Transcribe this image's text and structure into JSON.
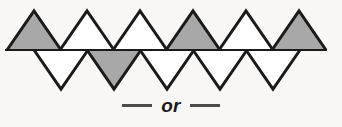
{
  "figure": {
    "name": "triangle-strip-tessellation",
    "background_color": "#f8f7f5",
    "stroke_color": "#1a1a1a",
    "shaded_fill": "#a8a8a8",
    "unshaded_fill": "#ffffff",
    "stroke_width": 3,
    "geometry": {
      "baseline_y": 50,
      "baseline_x_start": 5,
      "baseline_x_end": 327,
      "up_apex_y": 11,
      "down_apex_y": 89,
      "triangle_half_width": 27,
      "up_triangle_count": 6,
      "down_triangle_count": 5,
      "up_apex_x": [
        34,
        87,
        140,
        193,
        246,
        299
      ],
      "down_apex_x": [
        61,
        114,
        167,
        220,
        273
      ],
      "up_shaded_indices": [
        0,
        3,
        5
      ],
      "down_shaded_indices": [
        1
      ]
    }
  },
  "caption": {
    "dash_left": "—",
    "label": "or",
    "dash_right": "—"
  }
}
